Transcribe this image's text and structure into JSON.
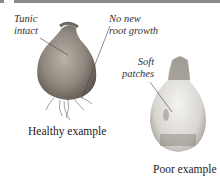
{
  "figure": {
    "healthy": {
      "caption": "Healthy example",
      "annotations": [
        {
          "line1": "Tunic",
          "line2": "intact"
        },
        {
          "line1": "No new",
          "line2": "root growth"
        }
      ]
    },
    "poor": {
      "caption": "Poor example",
      "annotations": [
        {
          "line1": "Soft",
          "line2": "patches"
        }
      ]
    }
  }
}
